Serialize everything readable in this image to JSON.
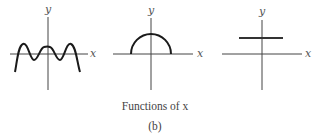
{
  "figure": {
    "caption": "Functions of x",
    "sublabel": "(b)",
    "panels": [
      {
        "name": "oscillating-polynomial",
        "x_label": "x",
        "y_label": "y"
      },
      {
        "name": "semicircle",
        "x_label": "x",
        "y_label": "y"
      },
      {
        "name": "constant-function",
        "x_label": "x",
        "y_label": "y"
      }
    ]
  },
  "colors": {
    "axis": "#333333",
    "curve": "#1a1a1a",
    "text": "#555555"
  }
}
